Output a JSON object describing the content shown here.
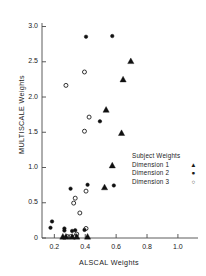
{
  "chart_data": {
    "type": "scatter",
    "title": "",
    "xlabel": "ALSCAL Weights",
    "ylabel": "MULTISCALE  Weights",
    "xlim": [
      0.12,
      1.13
    ],
    "ylim": [
      0.0,
      3.05
    ],
    "xticks": [
      0.2,
      0.4,
      0.6,
      0.8,
      1.0
    ],
    "xtick_labels": [
      "0.2",
      "0.4",
      "0.6",
      "0.8",
      "1.0"
    ],
    "yticks": [
      0.0,
      0.5,
      1.0,
      1.5,
      2.0,
      2.5,
      3.0
    ],
    "ytick_labels": [
      "0",
      "0.5",
      "1.0",
      "1.5",
      "2.0",
      "2.5",
      "3.0"
    ],
    "grid": false,
    "legend_position": "inside-right",
    "legend_title": "Subject Weights",
    "marker_color": "#101010",
    "series": [
      {
        "name": "Dimension 1",
        "marker": "filled-triangle",
        "points": [
          [
            0.255,
            0.02
          ],
          [
            0.275,
            0.02
          ],
          [
            0.315,
            0.02
          ],
          [
            0.345,
            0.02
          ],
          [
            0.415,
            0.02
          ],
          [
            0.525,
            0.72
          ],
          [
            0.575,
            1.03
          ],
          [
            0.635,
            1.49
          ],
          [
            0.535,
            1.82
          ],
          [
            0.645,
            2.25
          ],
          [
            0.695,
            2.51
          ]
        ]
      },
      {
        "name": "Dimension 2",
        "marker": "filled-circle",
        "points": [
          [
            0.175,
            0.145
          ],
          [
            0.185,
            0.235
          ],
          [
            0.265,
            0.105
          ],
          [
            0.265,
            0.135
          ],
          [
            0.315,
            0.1
          ],
          [
            0.335,
            0.11
          ],
          [
            0.395,
            0.115
          ],
          [
            0.305,
            0.7
          ],
          [
            0.415,
            0.755
          ],
          [
            0.585,
            0.745
          ],
          [
            0.495,
            1.655
          ],
          [
            0.405,
            2.855
          ],
          [
            0.575,
            2.865
          ]
        ]
      },
      {
        "name": "Dimension 3",
        "marker": "open-circle",
        "points": [
          [
            0.285,
            0.02
          ],
          [
            0.305,
            0.02
          ],
          [
            0.335,
            0.02
          ],
          [
            0.345,
            0.055
          ],
          [
            0.405,
            0.135
          ],
          [
            0.365,
            0.355
          ],
          [
            0.325,
            0.495
          ],
          [
            0.335,
            0.565
          ],
          [
            0.405,
            0.665
          ],
          [
            0.395,
            1.515
          ],
          [
            0.425,
            1.715
          ],
          [
            0.395,
            2.355
          ],
          [
            0.275,
            2.165
          ]
        ]
      }
    ]
  },
  "legend": {
    "title": "Subject Weights",
    "rows": [
      {
        "label": "Dimension  1",
        "key": "▲"
      },
      {
        "label": "Dimension  2",
        "key": "●"
      },
      {
        "label": "Dimension  3",
        "key": "○"
      }
    ]
  }
}
